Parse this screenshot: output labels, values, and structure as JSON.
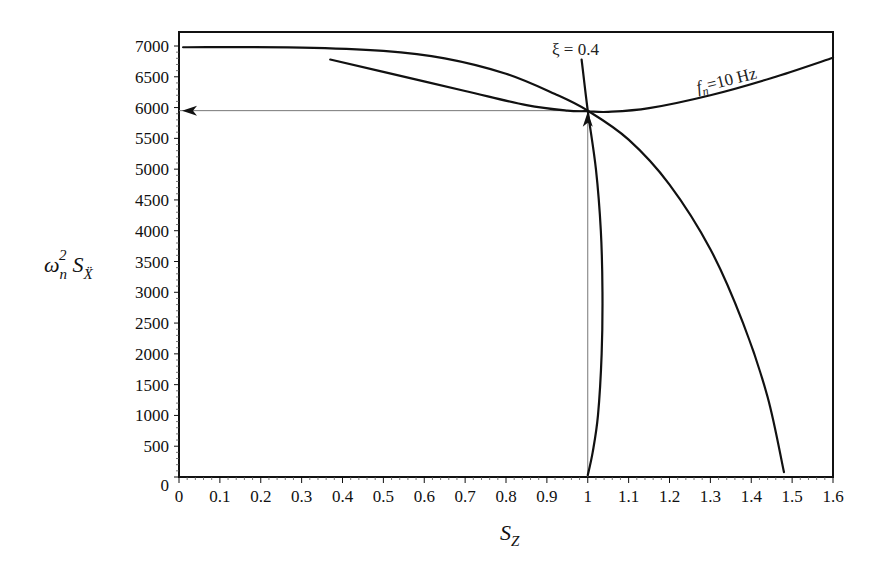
{
  "chart_data": {
    "type": "line",
    "title": "",
    "xlabel": "S_Z",
    "ylabel": "ω_n^2 S_Ẍ",
    "xlim": [
      0,
      1.6
    ],
    "ylim": [
      0,
      7000
    ],
    "grid": false,
    "legend": null,
    "x_ticks": [
      "0",
      "0.1",
      "0.2",
      "0.3",
      "0.4",
      "0.5",
      "0.6",
      "0.7",
      "0.8",
      "0.9",
      "1",
      "1.1",
      "1.2",
      "1.3",
      "1.4",
      "1.5",
      "1.6"
    ],
    "y_ticks": [
      "0",
      "500",
      "1000",
      "1500",
      "2000",
      "2500",
      "3000",
      "3500",
      "4000",
      "4500",
      "5000",
      "5500",
      "6000",
      "6500",
      "7000"
    ],
    "series": [
      {
        "name": "xi_0.4",
        "label": "ξ = 0.4",
        "points": [
          [
            0.01,
            6980
          ],
          [
            0.3,
            6975
          ],
          [
            0.5,
            6920
          ],
          [
            0.65,
            6800
          ],
          [
            0.8,
            6550
          ],
          [
            0.92,
            6220
          ],
          [
            1.0,
            5950
          ],
          [
            1.1,
            5480
          ],
          [
            1.2,
            4750
          ],
          [
            1.3,
            3700
          ],
          [
            1.38,
            2500
          ],
          [
            1.44,
            1300
          ],
          [
            1.48,
            80
          ]
        ]
      },
      {
        "name": "fn_10Hz",
        "label": "f_n=10 Hz",
        "points": [
          [
            0.37,
            6780
          ],
          [
            0.5,
            6580
          ],
          [
            0.7,
            6270
          ],
          [
            0.85,
            6040
          ],
          [
            0.95,
            5950
          ],
          [
            1.0,
            5940
          ],
          [
            1.05,
            5930
          ],
          [
            1.15,
            5990
          ],
          [
            1.3,
            6200
          ],
          [
            1.45,
            6480
          ],
          [
            1.6,
            6810
          ]
        ]
      },
      {
        "name": "xi_line_steep",
        "label": "",
        "points": [
          [
            0.985,
            6780
          ],
          [
            1.0,
            5950
          ],
          [
            1.02,
            5000
          ],
          [
            1.032,
            4000
          ],
          [
            1.036,
            3000
          ],
          [
            1.034,
            2000
          ],
          [
            1.025,
            1000
          ],
          [
            1.012,
            400
          ],
          [
            1.0,
            30
          ]
        ]
      }
    ],
    "guides": [
      {
        "from": [
          1.0,
          0
        ],
        "to": [
          1.0,
          5950
        ],
        "arrow": "up"
      },
      {
        "from": [
          1.0,
          5950
        ],
        "to": [
          0,
          5950
        ],
        "arrow": "left"
      }
    ],
    "annotations": [
      {
        "text": "ξ = 0.4",
        "x": 1.0,
        "y": 7000
      },
      {
        "text": "f_n=10 Hz",
        "x": 1.33,
        "y": 6600
      }
    ]
  },
  "labels": {
    "xi": "ξ = 0.4",
    "fn_f": "f",
    "fn_sub": "n",
    "fn_rest": "=10 Hz",
    "y_omega": "ω",
    "y_sub_n": "n",
    "y_sup_2": "2",
    "y_S": "S",
    "y_sub_X": "Ẍ",
    "x_S": "S",
    "x_sub_Z": "Z"
  }
}
